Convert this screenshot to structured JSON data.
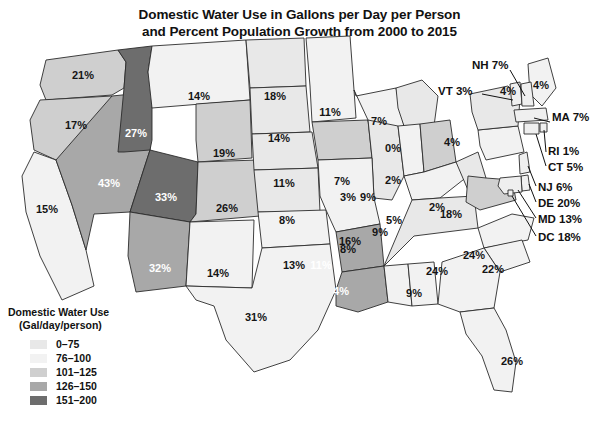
{
  "title": {
    "line1": "Domestic Water Use in Gallons per Day per Person",
    "line2": "and Percent Population Growth from 2000 to 2015"
  },
  "legend": {
    "title_line1": "Domestic Water Use",
    "title_line2": "(Gal/day/person)",
    "items": [
      {
        "label": "0–75",
        "color": "#e8e8e8"
      },
      {
        "label": "76–100",
        "color": "#f2f2f2"
      },
      {
        "label": "101–125",
        "color": "#cfcfcf"
      },
      {
        "label": "126–150",
        "color": "#a8a8a8"
      },
      {
        "label": "151–200",
        "color": "#6d6d6d"
      }
    ]
  },
  "chart_data": {
    "type": "choropleth",
    "title": "Domestic Water Use in Gallons per Day per Person and Percent Population Growth from 2000 to 2015",
    "value_label": "Percent Population Growth 2000–2015",
    "fill_label": "Domestic Water Use (Gal/day/person)",
    "legend_position": "bottom-left",
    "bins": [
      "0–75",
      "76–100",
      "101–125",
      "126–150",
      "151–200"
    ],
    "states": [
      {
        "code": "WA",
        "label": "21%",
        "value": 21,
        "bin": 2
      },
      {
        "code": "OR",
        "label": "17%",
        "value": 17,
        "bin": 2
      },
      {
        "code": "ID",
        "label": "27%",
        "value": 27,
        "bin": 4
      },
      {
        "code": "MT",
        "label": "14%",
        "value": 14,
        "bin": 1
      },
      {
        "code": "WY",
        "label": "19%",
        "value": 19,
        "bin": 2
      },
      {
        "code": "ND",
        "label": "18%",
        "value": 18,
        "bin": 0
      },
      {
        "code": "SD",
        "label": "14%",
        "value": 14,
        "bin": 0
      },
      {
        "code": "NE",
        "label": "11%",
        "value": 11,
        "bin": 0
      },
      {
        "code": "KS",
        "label": "8%",
        "value": 8,
        "bin": 0
      },
      {
        "code": "MN",
        "label": "11%",
        "value": 11,
        "bin": 1
      },
      {
        "code": "IA",
        "label": "7%",
        "value": 7,
        "bin": 2
      },
      {
        "code": "WI",
        "label": "7%",
        "value": 7,
        "bin": 1
      },
      {
        "code": "MO",
        "label": "8%",
        "value": 8,
        "bin": 1
      },
      {
        "code": "IL",
        "label": "3%",
        "value": 3,
        "bin": 0
      },
      {
        "code": "MI",
        "label": "0%",
        "value": 0,
        "bin": 0
      },
      {
        "code": "IN",
        "label": "9%",
        "value": 9,
        "bin": 1
      },
      {
        "code": "OH",
        "label": "2%",
        "value": 2,
        "bin": 2
      },
      {
        "code": "KY",
        "label": "9%",
        "value": 9,
        "bin": 1
      },
      {
        "code": "WV",
        "label": "2%",
        "value": 2,
        "bin": 0
      },
      {
        "code": "VA",
        "label": "18%",
        "value": 18,
        "bin": 2
      },
      {
        "code": "PA",
        "label": "4%",
        "value": 4,
        "bin": 1
      },
      {
        "code": "NY",
        "label": "4%",
        "value": 4,
        "bin": 0
      },
      {
        "code": "ME",
        "label": "4%",
        "value": 4,
        "bin": 1
      },
      {
        "code": "CA",
        "label": "15%",
        "value": 15,
        "bin": 1
      },
      {
        "code": "NV",
        "label": "43%",
        "value": 43,
        "bin": 3
      },
      {
        "code": "UT",
        "label": "33%",
        "value": 33,
        "bin": 4
      },
      {
        "code": "CO",
        "label": "26%",
        "value": 26,
        "bin": 2
      },
      {
        "code": "AZ",
        "label": "32%",
        "value": 32,
        "bin": 3
      },
      {
        "code": "NM",
        "label": "14%",
        "value": 14,
        "bin": 1
      },
      {
        "code": "TX",
        "label": "31%",
        "value": 31,
        "bin": 1
      },
      {
        "code": "OK",
        "label": "13%",
        "value": 13,
        "bin": 1
      },
      {
        "code": "AR",
        "label": "11%",
        "value": 11,
        "bin": 3
      },
      {
        "code": "LA",
        "label": "4%",
        "value": 4,
        "bin": 3
      },
      {
        "code": "MS",
        "label": "5%",
        "value": 5,
        "bin": 1
      },
      {
        "code": "AL",
        "label": "9%",
        "value": 9,
        "bin": 1
      },
      {
        "code": "TN",
        "label": "16%",
        "value": 16,
        "bin": 0
      },
      {
        "code": "GA",
        "label": "24%",
        "value": 24,
        "bin": 1
      },
      {
        "code": "SC",
        "label": "22%",
        "value": 22,
        "bin": 1
      },
      {
        "code": "NC",
        "label": "24%",
        "value": 24,
        "bin": 1
      },
      {
        "code": "FL",
        "label": "26%",
        "value": 26,
        "bin": 1
      }
    ],
    "callouts": [
      {
        "code": "NH",
        "label": "NH 7%",
        "value": 7
      },
      {
        "code": "VT",
        "label": "VT 3%",
        "value": 3
      },
      {
        "code": "MA",
        "label": "MA 7%",
        "value": 7
      },
      {
        "code": "RI",
        "label": "RI 1%",
        "value": 1
      },
      {
        "code": "CT",
        "label": "CT 5%",
        "value": 5
      },
      {
        "code": "NJ",
        "label": "NJ 6%",
        "value": 6
      },
      {
        "code": "DE",
        "label": "DE 20%",
        "value": 20
      },
      {
        "code": "MD",
        "label": "MD 13%",
        "value": 13
      },
      {
        "code": "DC",
        "label": "DC 18%",
        "value": 18
      }
    ]
  }
}
